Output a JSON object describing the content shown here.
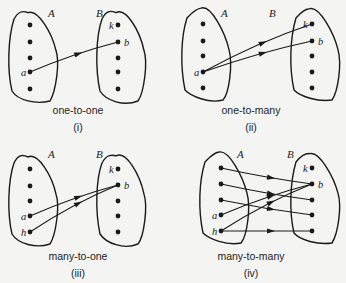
{
  "style": {
    "ink": "#1a1a1a",
    "background": "#f4f4f2"
  },
  "panels": [
    {
      "id": "i",
      "caption": "one-to-one",
      "number": "(i)",
      "origin": [
        0,
        0
      ],
      "setA": {
        "label": "A",
        "label_pos": [
          48,
          17
        ],
        "dots": [
          [
            30,
            25
          ],
          [
            30,
            42
          ],
          [
            30,
            58
          ],
          [
            30,
            72
          ],
          [
            30,
            89
          ]
        ],
        "element_labels": [
          {
            "text": "a",
            "dot": 3
          }
        ]
      },
      "setB": {
        "label": "B",
        "label_pos": [
          96,
          17
        ],
        "dots": [
          [
            118,
            25
          ],
          [
            118,
            42
          ],
          [
            118,
            58
          ],
          [
            118,
            72
          ],
          [
            118,
            89
          ]
        ],
        "element_labels": [
          {
            "text": "k",
            "dot": 0,
            "side": "left"
          },
          {
            "text": "b",
            "dot": 1,
            "side": "right"
          }
        ]
      },
      "arrows": [
        {
          "from": [
            "A",
            3
          ],
          "to": [
            "B",
            1
          ]
        }
      ]
    },
    {
      "id": "ii",
      "caption": "one-to-many",
      "number": "(ii)",
      "origin": [
        173,
        0
      ],
      "setA": {
        "label": "A",
        "label_pos": [
          48,
          17
        ],
        "dots": [
          [
            30,
            24
          ],
          [
            30,
            41
          ],
          [
            30,
            56
          ],
          [
            30,
            72
          ],
          [
            30,
            88
          ]
        ],
        "element_labels": [
          {
            "text": "a",
            "dot": 3
          }
        ]
      },
      "setB": {
        "label": "B",
        "label_pos": [
          96,
          17
        ],
        "dots": [
          [
            139,
            24
          ],
          [
            139,
            41
          ],
          [
            139,
            56
          ],
          [
            139,
            72
          ],
          [
            139,
            88
          ]
        ],
        "element_labels": [
          {
            "text": "k",
            "dot": 0,
            "side": "left"
          },
          {
            "text": "b",
            "dot": 1,
            "side": "right"
          }
        ]
      },
      "arrows": [
        {
          "from": [
            "A",
            3
          ],
          "to": [
            "B",
            0
          ]
        },
        {
          "from": [
            "A",
            3
          ],
          "to": [
            "B",
            1
          ]
        }
      ]
    },
    {
      "id": "iii",
      "caption": "many-to-one",
      "number": "(iii)",
      "origin": [
        0,
        141
      ],
      "setA": {
        "label": "A",
        "label_pos": [
          48,
          17
        ],
        "dots": [
          [
            30,
            28
          ],
          [
            30,
            45
          ],
          [
            30,
            60
          ],
          [
            30,
            75
          ],
          [
            30,
            91
          ]
        ],
        "element_labels": [
          {
            "text": "a",
            "dot": 3
          },
          {
            "text": "h",
            "dot": 4
          }
        ]
      },
      "setB": {
        "label": "B",
        "label_pos": [
          96,
          17
        ],
        "dots": [
          [
            118,
            28
          ],
          [
            118,
            44
          ],
          [
            118,
            60
          ],
          [
            118,
            75
          ],
          [
            118,
            91
          ]
        ],
        "element_labels": [
          {
            "text": "k",
            "dot": 0,
            "side": "left"
          },
          {
            "text": "b",
            "dot": 1,
            "side": "right"
          }
        ]
      },
      "arrows": [
        {
          "from": [
            "A",
            3
          ],
          "to": [
            "B",
            1
          ]
        },
        {
          "from": [
            "A",
            4
          ],
          "to": [
            "B",
            1
          ]
        }
      ]
    },
    {
      "id": "iv",
      "caption": "many-to-many",
      "number": "(iv)",
      "origin": [
        173,
        141
      ],
      "setA": {
        "label": "A",
        "label_pos": [
          64,
          17
        ],
        "dots": [
          [
            48,
            27
          ],
          [
            48,
            43
          ],
          [
            48,
            59
          ],
          [
            48,
            74
          ],
          [
            48,
            90
          ]
        ],
        "element_labels": [
          {
            "text": "a",
            "dot": 3
          },
          {
            "text": "h",
            "dot": 4
          }
        ]
      },
      "setB": {
        "label": "B",
        "label_pos": [
          114,
          17
        ],
        "dots": [
          [
            139,
            27
          ],
          [
            139,
            43
          ],
          [
            139,
            59
          ],
          [
            139,
            74
          ],
          [
            139,
            90
          ]
        ],
        "element_labels": [
          {
            "text": "k",
            "dot": 0,
            "side": "left"
          },
          {
            "text": "b",
            "dot": 1,
            "side": "right"
          }
        ]
      },
      "arrows": [
        {
          "from": [
            "A",
            0
          ],
          "to": [
            "B",
            1
          ]
        },
        {
          "from": [
            "A",
            1
          ],
          "to": [
            "B",
            2
          ]
        },
        {
          "from": [
            "A",
            2
          ],
          "to": [
            "B",
            3
          ]
        },
        {
          "from": [
            "A",
            3
          ],
          "to": [
            "B",
            1
          ]
        },
        {
          "from": [
            "A",
            4
          ],
          "to": [
            "B",
            1
          ]
        },
        {
          "from": [
            "A",
            4
          ],
          "to": [
            "B",
            4
          ]
        }
      ]
    }
  ]
}
